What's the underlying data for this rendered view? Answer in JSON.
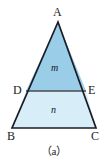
{
  "figure": {
    "caption": "（a）",
    "background_color": "#ffffff",
    "stroke_color": "#1b1b24",
    "divider_color": "#4a4a52",
    "upper_fill_color": "#9acde8",
    "lower_fill_color": "#d7edf8",
    "vertices": {
      "A": {
        "label": "A",
        "x": 58,
        "y": 22
      },
      "B": {
        "label": "B",
        "x": 12,
        "y": 128
      },
      "C": {
        "label": "C",
        "x": 96,
        "y": 128
      },
      "D": {
        "label": "D",
        "x": 26,
        "y": 91
      },
      "E": {
        "label": "E",
        "x": 86,
        "y": 91
      }
    },
    "regions": {
      "upper": {
        "label": "m",
        "shape": "triangle",
        "points": "A D E"
      },
      "lower": {
        "label": "n",
        "shape": "trapezoid",
        "points": "D B C E"
      }
    },
    "polygon_points": {
      "outer_triangle": "58,22 12,128 96,128",
      "upper_triangle": "58,22 26,91 86,91",
      "lower_trapezoid": "26,91 12,128 96,128 86,91"
    },
    "divider_segment": {
      "from": "D",
      "to": "E",
      "x1": 26,
      "y1": 91,
      "x2": 86,
      "y2": 91
    }
  }
}
